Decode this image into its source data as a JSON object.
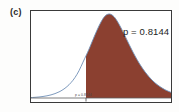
{
  "figure": {
    "panel_label": "(c)",
    "p_annotation": "p = 0.8144",
    "cutoff_label": "p = 0.8144"
  },
  "colors": {
    "fill": "#8B4030",
    "curve": "#6F8FB5",
    "frame": "#3a3a3a",
    "baseline": "#5d5d5d",
    "background": "#fdfdfc",
    "text": "#1d1d1d"
  },
  "chart_data": {
    "type": "area",
    "title": "",
    "subtitle": "",
    "xlabel": "",
    "ylabel": "",
    "grid": false,
    "legend": null,
    "xlim": [
      0,
      142
    ],
    "ylim": [
      0,
      1
    ],
    "shaded_region": {
      "from_x": 55,
      "to_x": 142,
      "label": "p = 0.8144",
      "value": 0.8144
    },
    "cutoff": {
      "x": 55,
      "label": "p = 0.8144",
      "tick": true
    },
    "peak": {
      "x": 74,
      "y": 0.97
    },
    "x": [
      0,
      4,
      8,
      12,
      16,
      20,
      24,
      28,
      32,
      36,
      40,
      44,
      48,
      52,
      55,
      58,
      62,
      66,
      70,
      74,
      78,
      82,
      86,
      90,
      94,
      98,
      102,
      106,
      110,
      114,
      118,
      122,
      126,
      130,
      134,
      138,
      142
    ],
    "y": [
      0.005,
      0.008,
      0.012,
      0.018,
      0.026,
      0.037,
      0.052,
      0.072,
      0.099,
      0.135,
      0.182,
      0.243,
      0.323,
      0.425,
      0.5,
      0.578,
      0.692,
      0.803,
      0.9,
      0.97,
      0.995,
      0.975,
      0.915,
      0.83,
      0.735,
      0.637,
      0.543,
      0.456,
      0.378,
      0.31,
      0.251,
      0.201,
      0.16,
      0.126,
      0.098,
      0.076,
      0.058
    ]
  }
}
